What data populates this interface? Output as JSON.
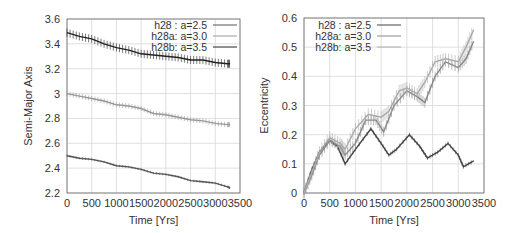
{
  "chart_data": [
    {
      "type": "line",
      "title": "",
      "xlabel": "Time [Yrs]",
      "ylabel": "Semi-Major Axis",
      "xlim": [
        0,
        3500
      ],
      "ylim": [
        2.2,
        3.6
      ],
      "xticks": [
        0,
        500,
        1000,
        1500,
        2000,
        2500,
        3000,
        3500
      ],
      "yticks": [
        2.2,
        2.4,
        2.6,
        2.8,
        3.0,
        3.2,
        3.4,
        3.6
      ],
      "ytick_labels": [
        "2.2",
        "2.4",
        "2.6",
        "2.8",
        "3",
        "3.2",
        "3.4",
        "3.6"
      ],
      "grid": true,
      "legend_position": "top-right",
      "series": [
        {
          "name": "h28 : a=2.5",
          "color": "#555555",
          "x": [
            0,
            250,
            500,
            750,
            1000,
            1250,
            1500,
            1750,
            2000,
            2250,
            2500,
            2750,
            3000,
            3250,
            3300
          ],
          "values": [
            2.5,
            2.48,
            2.47,
            2.45,
            2.42,
            2.41,
            2.39,
            2.36,
            2.35,
            2.33,
            2.3,
            2.29,
            2.28,
            2.25,
            2.24
          ]
        },
        {
          "name": "h28a: a=3.0",
          "color": "#999999",
          "x": [
            0,
            250,
            500,
            750,
            1000,
            1250,
            1500,
            1750,
            2000,
            2250,
            2500,
            2750,
            3000,
            3250,
            3300
          ],
          "values": [
            3.0,
            2.98,
            2.96,
            2.94,
            2.91,
            2.9,
            2.88,
            2.84,
            2.83,
            2.81,
            2.79,
            2.78,
            2.76,
            2.75,
            2.75
          ]
        },
        {
          "name": "h28b: a=3.5",
          "color": "#222222",
          "x": [
            0,
            250,
            500,
            750,
            1000,
            1250,
            1500,
            1750,
            2000,
            2250,
            2500,
            2750,
            3000,
            3250,
            3300
          ],
          "values": [
            3.49,
            3.46,
            3.44,
            3.4,
            3.37,
            3.35,
            3.32,
            3.31,
            3.3,
            3.29,
            3.27,
            3.27,
            3.25,
            3.24,
            3.24
          ]
        }
      ]
    },
    {
      "type": "line",
      "title": "",
      "xlabel": "Time [Yrs]",
      "ylabel": "Eccentricity",
      "xlim": [
        0,
        3500
      ],
      "ylim": [
        0,
        0.6
      ],
      "xticks": [
        0,
        500,
        1000,
        1500,
        2000,
        2500,
        3000,
        3500
      ],
      "yticks": [
        0,
        0.1,
        0.2,
        0.3,
        0.4,
        0.5,
        0.6
      ],
      "ytick_labels": [
        "0",
        "0.1",
        "0.2",
        "0.3",
        "0.4",
        "0.5",
        "0.6"
      ],
      "grid": true,
      "legend_position": "top-left",
      "series": [
        {
          "name": "h28 : a=2.5",
          "color": "#444444",
          "x": [
            0,
            150,
            300,
            500,
            650,
            800,
            1000,
            1300,
            1500,
            1650,
            1800,
            2050,
            2250,
            2400,
            2600,
            2800,
            3000,
            3100,
            3300
          ],
          "values": [
            0,
            0.08,
            0.14,
            0.18,
            0.16,
            0.1,
            0.15,
            0.22,
            0.17,
            0.13,
            0.15,
            0.2,
            0.16,
            0.12,
            0.14,
            0.17,
            0.13,
            0.09,
            0.11
          ]
        },
        {
          "name": "h28a: a=3.0",
          "color": "#888888",
          "x": [
            0,
            150,
            300,
            500,
            700,
            800,
            1000,
            1200,
            1400,
            1550,
            1750,
            2000,
            2200,
            2350,
            2550,
            2750,
            3000,
            3150,
            3300
          ],
          "values": [
            0,
            0.06,
            0.13,
            0.18,
            0.16,
            0.13,
            0.17,
            0.25,
            0.25,
            0.21,
            0.3,
            0.35,
            0.33,
            0.31,
            0.4,
            0.45,
            0.43,
            0.46,
            0.52
          ]
        },
        {
          "name": "h28b: a=3.5",
          "color": "#aaaaaa",
          "x": [
            0,
            150,
            300,
            500,
            700,
            800,
            1000,
            1250,
            1500,
            1650,
            1850,
            2000,
            2200,
            2350,
            2550,
            2750,
            3000,
            3150,
            3300
          ],
          "values": [
            0,
            0.07,
            0.14,
            0.19,
            0.17,
            0.15,
            0.22,
            0.27,
            0.26,
            0.28,
            0.35,
            0.36,
            0.34,
            0.38,
            0.45,
            0.46,
            0.45,
            0.5,
            0.56
          ]
        }
      ]
    }
  ]
}
